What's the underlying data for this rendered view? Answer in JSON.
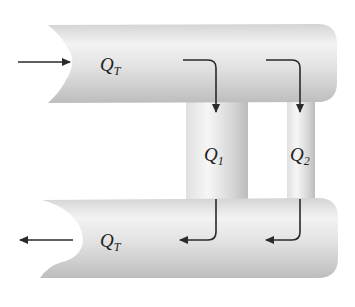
{
  "diagram": {
    "type": "parallel-pipe-flow",
    "labels": {
      "inlet_flow": {
        "symbol": "Q",
        "subscript": "T"
      },
      "branch_1": {
        "symbol": "Q",
        "subscript": "1"
      },
      "branch_2": {
        "symbol": "Q",
        "subscript": "2"
      },
      "outlet_flow": {
        "symbol": "Q",
        "subscript": "T"
      }
    },
    "arrows": {
      "inlet": "right",
      "branch_1_entry": "right-then-down",
      "branch_2_entry": "right-then-down",
      "branch_1_exit": "down-then-left",
      "branch_2_exit": "down-then-left",
      "outlet": "left"
    },
    "colors": {
      "pipe_light": "#f4f4f4",
      "pipe_mid": "#d9d9d9",
      "pipe_dark": "#b8b8b8",
      "arrow": "#2a2a2a"
    }
  }
}
